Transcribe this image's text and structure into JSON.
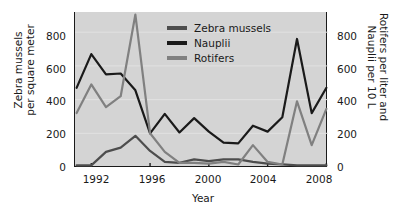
{
  "chart_data": {
    "type": "line",
    "title": "",
    "xlabel": "Year",
    "ylabel": "Zebra mussels per square meter",
    "ylabel_right": "Rotifers per liter and Nauplii per 10 L",
    "xlim": [
      1991,
      2008
    ],
    "ylim": [
      0,
      920
    ],
    "ylim_right": [
      0,
      920
    ],
    "grid": true,
    "legend_position": "top-center",
    "x_ticks": [
      1992,
      1996,
      2000,
      2004,
      2008
    ],
    "y_ticks_left": [
      0,
      200,
      400,
      600,
      800
    ],
    "y_ticks_right": [
      0,
      200,
      400,
      600,
      800
    ],
    "x": [
      1991,
      1992,
      1993,
      1994,
      1995,
      1996,
      1997,
      1998,
      1999,
      2000,
      2001,
      2002,
      2003,
      2004,
      2005,
      2006,
      2007,
      2008
    ],
    "series": [
      {
        "name": "Zebra mussels",
        "color": "#4d4d4d",
        "axis": "left",
        "units": "per square meter",
        "values": [
          10,
          10,
          90,
          115,
          185,
          95,
          30,
          25,
          45,
          35,
          45,
          45,
          30,
          20,
          15,
          10,
          10,
          10
        ]
      },
      {
        "name": "Nauplii",
        "color": "#1a1a1a",
        "axis": "right",
        "units": "per 10 L",
        "values": [
          470,
          670,
          550,
          555,
          455,
          200,
          315,
          205,
          290,
          210,
          145,
          140,
          245,
          210,
          295,
          760,
          320,
          470
        ]
      },
      {
        "name": "Rotifers",
        "color": "#808080",
        "axis": "right",
        "units": "per liter",
        "values": [
          320,
          490,
          355,
          420,
          905,
          200,
          90,
          25,
          25,
          20,
          30,
          15,
          130,
          30,
          15,
          390,
          130,
          345
        ]
      }
    ]
  },
  "axes": {
    "left_title_line1": "Zebra mussels",
    "left_title_line2": "per square meter",
    "right_title_line1": "Rotifers per liter and",
    "right_title_line2": "Nauplii per 10 L",
    "x_title": "Year",
    "x_tick_labels": [
      "1992",
      "1996",
      "2000",
      "2004",
      "2008"
    ],
    "y_tick_labels_left": [
      "0",
      "200",
      "400",
      "600",
      "800"
    ],
    "y_tick_labels_right": [
      "0",
      "200",
      "400",
      "600",
      "800"
    ]
  },
  "legend": {
    "items": [
      {
        "label": "Zebra mussels",
        "color": "#4d4d4d"
      },
      {
        "label": "Nauplii",
        "color": "#1a1a1a"
      },
      {
        "label": "Rotifers",
        "color": "#808080"
      }
    ]
  },
  "colors": {
    "plot_background": "#d4d4d4",
    "page_background": "#ffffff",
    "axis": "#1a1a1a",
    "gridline": "#e2e2e2"
  }
}
